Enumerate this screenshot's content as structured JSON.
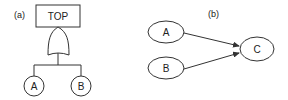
{
  "panel_a": {
    "label": "(a)",
    "top_event": "TOP",
    "gate": "OR",
    "basic_events": [
      "A",
      "B"
    ]
  },
  "panel_b": {
    "label": "(b)",
    "nodes": [
      "A",
      "B",
      "C"
    ],
    "edges": [
      {
        "from": "A",
        "to": "C"
      },
      {
        "from": "B",
        "to": "C"
      }
    ]
  },
  "colors": {
    "line": "#333333",
    "text": "#222222",
    "background": "#ffffff"
  }
}
